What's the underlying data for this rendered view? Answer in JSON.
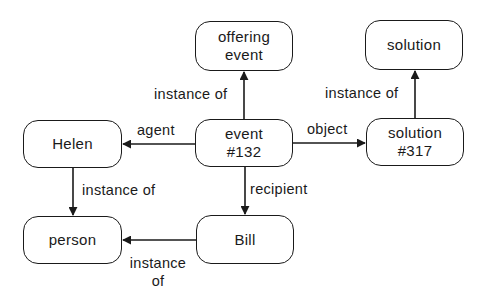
{
  "diagram": {
    "type": "semantic-network",
    "colors": {
      "stroke": "#1a1a1a",
      "background": "#ffffff",
      "text": "#1a1a1a"
    },
    "nodes": {
      "offering_event": {
        "line1": "offering",
        "line2": "event"
      },
      "solution": {
        "line1": "solution"
      },
      "helen": {
        "line1": "Helen"
      },
      "event_132": {
        "line1": "event",
        "line2": "#132"
      },
      "solution_317": {
        "line1": "solution",
        "line2": "#317"
      },
      "person": {
        "line1": "person"
      },
      "bill": {
        "line1": "Bill"
      }
    },
    "edges": {
      "event_to_offering": {
        "from": "event #132",
        "to": "offering event",
        "label": "instance of"
      },
      "solution317_to_solution": {
        "from": "solution #317",
        "to": "solution",
        "label": "instance of"
      },
      "event_to_helen": {
        "from": "event #132",
        "to": "Helen",
        "label": "agent"
      },
      "event_to_solution317": {
        "from": "event #132",
        "to": "solution #317",
        "label": "object"
      },
      "helen_to_person": {
        "from": "Helen",
        "to": "person",
        "label": "instance of"
      },
      "event_to_bill": {
        "from": "event #132",
        "to": "Bill",
        "label": "recipient"
      },
      "bill_to_person": {
        "from": "Bill",
        "to": "person",
        "label_line1": "instance",
        "label_line2": "of"
      }
    }
  }
}
